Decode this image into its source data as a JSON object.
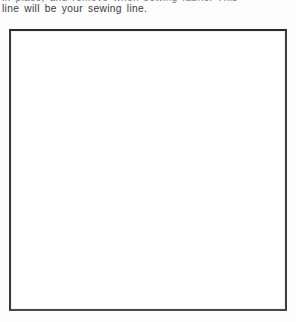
{
  "page": {
    "background_color": "#fdfdfd",
    "width": 296,
    "height": 322
  },
  "text": {
    "clipped_line": {
      "content": "in place, and remove when sewing fabric. This",
      "note_visible_portion": "only the lower sliver of this line is visible at the top crop edge"
    },
    "body_line": "line will be your sewing line."
  },
  "figure": {
    "label": "blank pattern template box",
    "border_color": "#2b2b2b",
    "fill_color": "#ffffff",
    "contents": ""
  }
}
